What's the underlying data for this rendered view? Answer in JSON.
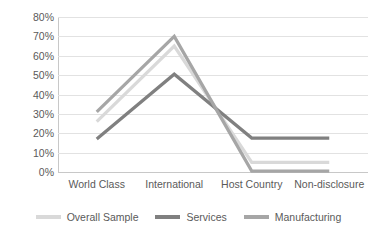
{
  "chart_data": {
    "type": "line",
    "title": "",
    "xlabel": "",
    "ylabel": "",
    "categories": [
      "World Class",
      "International",
      "Host Country",
      "Non-disclosure"
    ],
    "series": [
      {
        "name": "Overall Sample",
        "color": "#D9D9D9",
        "values": [
          26,
          65,
          5,
          5
        ]
      },
      {
        "name": "Services",
        "color": "#808080",
        "values": [
          17,
          50.5,
          17.5,
          17.5
        ]
      },
      {
        "name": "Manufacturing",
        "color": "#A6A6A6",
        "values": [
          31,
          70,
          0.5,
          0.5
        ]
      }
    ],
    "ylim": [
      0,
      80
    ],
    "ytick_step": 10,
    "ytick_labels": [
      "80%",
      "70%",
      "60%",
      "50%",
      "40%",
      "30%",
      "20%",
      "10%",
      "0%"
    ],
    "ytick_values": [
      80,
      70,
      60,
      50,
      40,
      30,
      20,
      10,
      0
    ],
    "grid": true,
    "legend_position": "bottom",
    "gridline_color": "#E2E2E2",
    "axis_color": "#C8C8C8",
    "text_color": "#5A5A5A",
    "background": "#FFFFFF"
  }
}
